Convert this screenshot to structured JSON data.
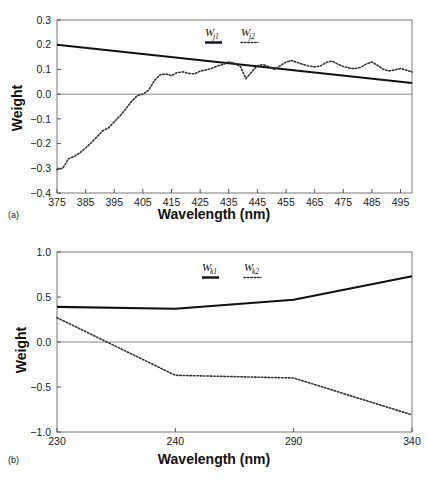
{
  "figure": {
    "panels": [
      {
        "tag": "(a)",
        "name": "panel-a",
        "xlabel": "Wavelength (nm)",
        "ylabel": "Weight"
      },
      {
        "tag": "(b)",
        "name": "panel-b",
        "xlabel": "Wavelength (nm)",
        "ylabel": "Weight"
      }
    ]
  },
  "chart_data": [
    {
      "type": "line",
      "panel": "(a)",
      "title": "",
      "xlabel": "Wavelength (nm)",
      "ylabel": "Weight",
      "xlim": [
        375,
        499
      ],
      "ylim": [
        -0.4,
        0.3
      ],
      "yticks": [
        0.3,
        0.2,
        0.1,
        0.0,
        -0.1,
        -0.2,
        -0.3,
        -0.4
      ],
      "ytick_labels": [
        "0.3",
        "0.2",
        "0.1",
        "0.0",
        "−0.1",
        "−0.2",
        "−0.3",
        "−0.4"
      ],
      "xticks": [
        375,
        385,
        395,
        405,
        415,
        425,
        435,
        445,
        455,
        465,
        475,
        485,
        495
      ],
      "xtick_labels": [
        "375",
        "385",
        "395",
        "405",
        "415",
        "425",
        "435",
        "445",
        "455",
        "465",
        "475",
        "485",
        "495"
      ],
      "grid": false,
      "zero_line": true,
      "legend_position": "top-center",
      "series": [
        {
          "name": "W_j1",
          "label": "W",
          "subscript": "j1",
          "style": "solid",
          "color": "#111111",
          "x": [
            375,
            499
          ],
          "values": [
            0.2,
            0.045
          ]
        },
        {
          "name": "W_j2",
          "label": "W",
          "subscript": "j2",
          "style": "dotted",
          "color": "#333333",
          "x": [
            375,
            377,
            379,
            381,
            383,
            385,
            387,
            389,
            391,
            393,
            395,
            397,
            399,
            401,
            403,
            405,
            407,
            409,
            411,
            413,
            415,
            417,
            419,
            421,
            423,
            425,
            427,
            429,
            431,
            433,
            435,
            437,
            439,
            441,
            443,
            445,
            447,
            449,
            451,
            453,
            455,
            457,
            459,
            461,
            463,
            465,
            467,
            469,
            471,
            473,
            475,
            477,
            479,
            481,
            483,
            485,
            487,
            489,
            491,
            493,
            495,
            497,
            499
          ],
          "values": [
            -0.305,
            -0.3,
            -0.262,
            -0.252,
            -0.238,
            -0.218,
            -0.196,
            -0.172,
            -0.148,
            -0.136,
            -0.112,
            -0.088,
            -0.06,
            -0.03,
            -0.006,
            0.0,
            0.016,
            0.055,
            0.078,
            0.082,
            0.075,
            0.087,
            0.09,
            0.084,
            0.082,
            0.093,
            0.098,
            0.104,
            0.114,
            0.12,
            0.13,
            0.125,
            0.112,
            0.063,
            0.09,
            0.115,
            0.12,
            0.111,
            0.1,
            0.115,
            0.13,
            0.136,
            0.128,
            0.12,
            0.114,
            0.11,
            0.114,
            0.128,
            0.134,
            0.122,
            0.112,
            0.106,
            0.103,
            0.108,
            0.122,
            0.13,
            0.116,
            0.1,
            0.094,
            0.098,
            0.104,
            0.097,
            0.09
          ]
        }
      ]
    },
    {
      "type": "line",
      "panel": "(b)",
      "title": "",
      "xlabel": "Wavelength (nm)",
      "ylabel": "Weight",
      "ylim": [
        -1.0,
        1.0
      ],
      "yticks": [
        1.0,
        0.5,
        0.0,
        -0.5,
        -1.0
      ],
      "ytick_labels": [
        "1.0",
        "0.5",
        "0.0",
        "−0.5",
        "−1.0"
      ],
      "xticks": [
        230,
        240,
        290,
        340
      ],
      "xtick_labels": [
        "230",
        "240",
        "290",
        "340"
      ],
      "xtick_spacing": "categorical",
      "grid": false,
      "zero_line": true,
      "legend_position": "top-center",
      "series": [
        {
          "name": "W_k1",
          "label": "W",
          "subscript": "k1",
          "style": "solid",
          "color": "#111111",
          "categories": [
            "230",
            "240",
            "290",
            "340"
          ],
          "values": [
            0.39,
            0.37,
            0.47,
            0.73
          ]
        },
        {
          "name": "W_k2",
          "label": "W",
          "subscript": "k2",
          "style": "dotted",
          "color": "#333333",
          "categories": [
            "230",
            "240",
            "290",
            "340"
          ],
          "values": [
            0.27,
            -0.37,
            -0.4,
            -0.81
          ]
        }
      ]
    }
  ]
}
